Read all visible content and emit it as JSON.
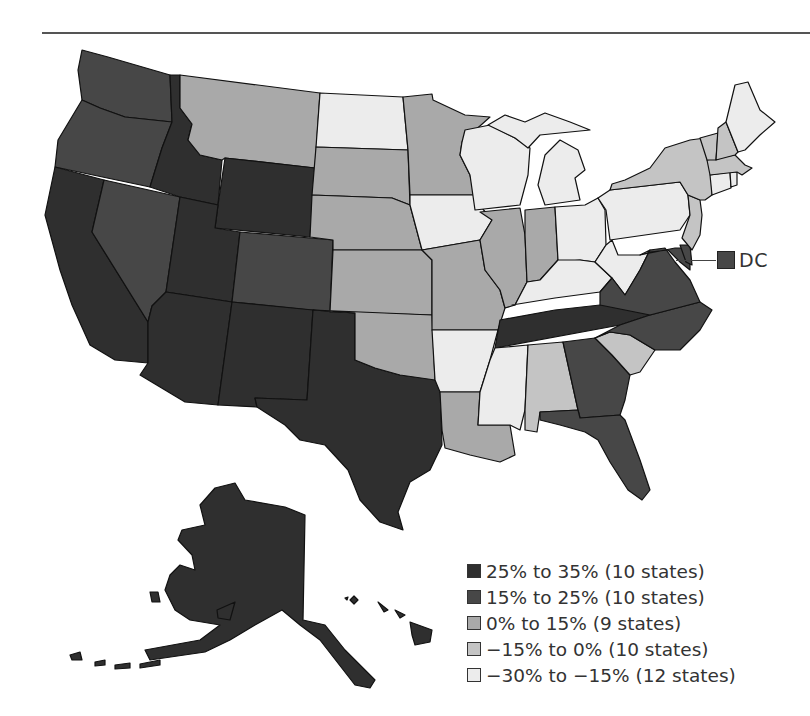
{
  "colors": {
    "c1": "#2f2f2f",
    "c2": "#474747",
    "c3": "#a9a9a9",
    "c4": "#c4c4c4",
    "c5": "#ececec"
  },
  "legend": {
    "items": [
      {
        "label": "25% to 35% (10 states)",
        "color": "#2f2f2f"
      },
      {
        "label": "15% to 25% (10 states)",
        "color": "#474747"
      },
      {
        "label": "0% to 15% (9 states)",
        "color": "#a9a9a9"
      },
      {
        "label": "−15% to 0% (10 states)",
        "color": "#c4c4c4"
      },
      {
        "label": "−30% to −15% (12 states)",
        "color": "#ececec"
      }
    ]
  },
  "dc": {
    "label": "DC",
    "color": "#474747"
  },
  "states": {
    "WA": "c2",
    "OR": "c2",
    "CA": "c1",
    "NV": "c2",
    "ID": "c1",
    "MT": "c3",
    "WY": "c1",
    "UT": "c1",
    "CO": "c2",
    "AZ": "c1",
    "NM": "c1",
    "TX": "c1",
    "ND": "c5",
    "SD": "c3",
    "NE": "c3",
    "KS": "c3",
    "OK": "c3",
    "MN": "c3",
    "IA": "c5",
    "MO": "c3",
    "AR": "c5",
    "LA": "c3",
    "WI": "c5",
    "IL": "c3",
    "MI": "c5",
    "IN": "c3",
    "OH": "c5",
    "KY": "c5",
    "TN": "c1",
    "MS": "c5",
    "AL": "c4",
    "GA": "c2",
    "FL": "c2",
    "SC": "c4",
    "NC": "c2",
    "VA": "c2",
    "WV": "c5",
    "MD": "c2",
    "DE": "c2",
    "PA": "c5",
    "NJ": "c4",
    "NY": "c4",
    "CT": "c5",
    "RI": "c5",
    "MA": "c4",
    "VT": "c4",
    "NH": "c4",
    "ME": "c5",
    "AK": "c1",
    "HI": "c1"
  }
}
